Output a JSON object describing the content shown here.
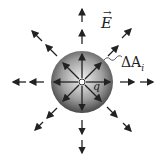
{
  "diagram": {
    "labels": {
      "field": "E",
      "area_element": "ΔA",
      "area_subscript": "i",
      "charge": "q"
    },
    "colors": {
      "arrow": "#222222",
      "sphere_light": "#eeeeee",
      "sphere_dark": "#555555"
    }
  }
}
